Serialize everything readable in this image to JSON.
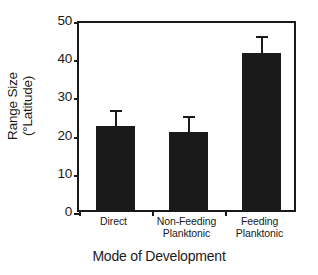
{
  "chart_data": {
    "type": "bar",
    "title": "",
    "xlabel": "Mode of Development",
    "ylabel_line1": "Range Size",
    "ylabel_line2": "(°Latitude)",
    "categories": [
      "Direct",
      "Non-Feeding Planktonic",
      "Feeding Planktonic"
    ],
    "category_lines": [
      {
        "line1": "Direct",
        "line2": ""
      },
      {
        "line1": "Non-Feeding",
        "line2": "Planktonic"
      },
      {
        "line1": "Feeding",
        "line2": "Planktonic"
      }
    ],
    "values": [
      22,
      20.4,
      41
    ],
    "errors": [
      3.6,
      3.6,
      4
    ],
    "ylim": [
      0,
      50
    ],
    "yticks": [
      0,
      10,
      20,
      30,
      40,
      50
    ],
    "ytick_labels": [
      "0",
      "10",
      "20",
      "30",
      "40",
      "50"
    ],
    "grid": false,
    "legend": "none",
    "bar_color": "#1a1a1a",
    "axis_color": "#1a1a1a",
    "background_color": "#ffffff"
  }
}
